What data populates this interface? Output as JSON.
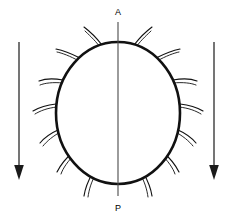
{
  "figure": {
    "background_color": "#ffffff",
    "stroke_color": "#111111",
    "axis_color": "#4a4a4a",
    "arrow_color": "#1a1a1a"
  },
  "axis": {
    "anterior_label": "A",
    "posterior_label": "P",
    "line_from_y": 22,
    "line_to_y": 196
  },
  "body": {
    "center_x": 118,
    "center_y": 113,
    "radius_x": 62,
    "radius_y": 71
  },
  "flow_arrows": [
    {
      "name": "left-flow-arrow",
      "direction": "down",
      "x": 19,
      "y_start": 42,
      "y_end": 178
    },
    {
      "name": "right-flow-arrow",
      "direction": "down",
      "x": 214,
      "y_start": 42,
      "y_end": 178
    }
  ],
  "cilia": {
    "count": 14,
    "description": "hook-shaped curved projections around the oval perimeter, curving clockwise",
    "items": [
      {
        "angle_deg": 104,
        "side": "left"
      },
      {
        "angle_deg": 128,
        "side": "left"
      },
      {
        "angle_deg": 152,
        "side": "left"
      },
      {
        "angle_deg": 176,
        "side": "left"
      },
      {
        "angle_deg": 200,
        "side": "left"
      },
      {
        "angle_deg": 224,
        "side": "left"
      },
      {
        "angle_deg": 250,
        "side": "left"
      },
      {
        "angle_deg": 76,
        "side": "right"
      },
      {
        "angle_deg": 52,
        "side": "right"
      },
      {
        "angle_deg": 28,
        "side": "right"
      },
      {
        "angle_deg": 4,
        "side": "right"
      },
      {
        "angle_deg": 340,
        "side": "right"
      },
      {
        "angle_deg": 316,
        "side": "right"
      },
      {
        "angle_deg": 290,
        "side": "right"
      }
    ]
  }
}
